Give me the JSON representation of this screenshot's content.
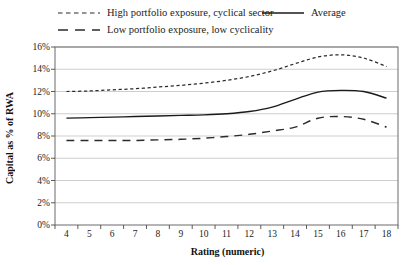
{
  "chart_data": {
    "type": "line",
    "title": "",
    "xlabel": "Rating (numeric)",
    "ylabel": "Capital as % of RWA",
    "xlim": [
      3.5,
      18.5
    ],
    "ylim": [
      0,
      16
    ],
    "xticks": [
      4,
      5,
      6,
      7,
      8,
      9,
      10,
      11,
      12,
      13,
      14,
      15,
      16,
      17,
      18
    ],
    "yticks": [
      0,
      2,
      4,
      6,
      8,
      10,
      12,
      14,
      16
    ],
    "ytick_labels": [
      "0%",
      "2%",
      "4%",
      "6%",
      "8%",
      "10%",
      "12%",
      "14%",
      "16%"
    ],
    "grid": "horizontal",
    "legend_position": "top",
    "x": [
      4,
      5,
      6,
      7,
      8,
      9,
      10,
      11,
      12,
      13,
      14,
      15,
      16,
      17,
      18
    ],
    "series": [
      {
        "name": "High portfolio exposure, cyclical sector",
        "style": "short-dashed",
        "color": "#2b2b2b",
        "values": [
          12.0,
          12.05,
          12.15,
          12.25,
          12.4,
          12.55,
          12.75,
          13.0,
          13.35,
          13.85,
          14.5,
          15.1,
          15.3,
          15.0,
          14.25
        ]
      },
      {
        "name": "Average",
        "style": "solid",
        "color": "#1a1a1a",
        "values": [
          9.6,
          9.65,
          9.7,
          9.75,
          9.8,
          9.85,
          9.9,
          10.0,
          10.2,
          10.6,
          11.3,
          11.95,
          12.1,
          12.0,
          11.4
        ]
      },
      {
        "name": "Low portfolio exposure, low cyclicality",
        "style": "long-dashed",
        "color": "#2b2b2b",
        "values": [
          7.6,
          7.6,
          7.6,
          7.6,
          7.65,
          7.7,
          7.8,
          7.95,
          8.15,
          8.45,
          8.8,
          9.6,
          9.75,
          9.5,
          8.8
        ]
      }
    ]
  },
  "legend": {
    "items": [
      {
        "label": "High portfolio exposure, cyclical sector",
        "style": "short-dashed"
      },
      {
        "label": "Average",
        "style": "solid"
      },
      {
        "label": "Low portfolio exposure, low cyclicality",
        "style": "long-dashed"
      }
    ]
  },
  "axes": {
    "x_title": "Rating (numeric)",
    "y_title": "Capital as % of RWA"
  }
}
